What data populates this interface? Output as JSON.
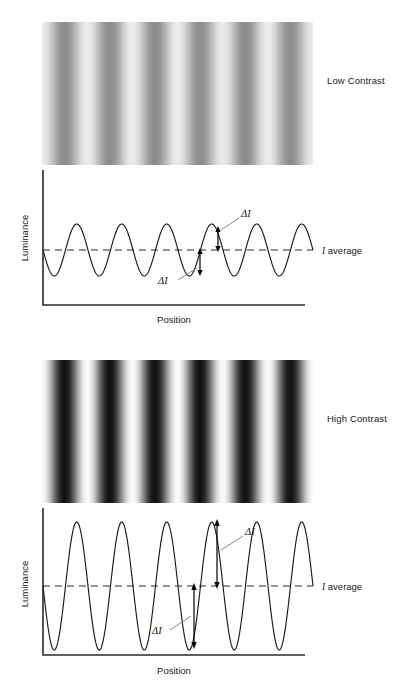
{
  "figure": {
    "background": "#ffffff",
    "width": 410,
    "height": 691
  },
  "panels": [
    {
      "id": "low",
      "side_label": "Low Contrast",
      "grating": {
        "name": "low-contrast-grating",
        "cycles": 6,
        "min_gray": "#8c8c8c",
        "max_gray": "#ebebeb"
      },
      "plot": {
        "ylabel": "Luminance",
        "xlabel": "Position",
        "average_label_symbol": "I",
        "average_label_text": " average",
        "delta_label_upper": "ΔI",
        "delta_label_lower": "ΔI"
      }
    },
    {
      "id": "high",
      "side_label": "High Contrast",
      "grating": {
        "name": "high-contrast-grating",
        "cycles": 6,
        "min_gray": "#111111",
        "max_gray": "#fbfbfb"
      },
      "plot": {
        "ylabel": "Luminance",
        "xlabel": "Position",
        "average_label_symbol": "I",
        "average_label_text": " average",
        "delta_label_upper": "ΔI",
        "delta_label_lower": "ΔI"
      }
    }
  ],
  "chart_data": [
    {
      "type": "line",
      "id": "low-contrast-luminance-profile",
      "title": "",
      "xlabel": "Position",
      "ylabel": "Luminance",
      "waveform": "sine",
      "cycles": 6,
      "phase": "descending-zero-crossing-at-origin",
      "mean_level": 0.5,
      "amplitude_fraction": 0.155,
      "ylim": [
        0,
        1
      ],
      "grid": false,
      "legend": false,
      "annotations": [
        {
          "label": "ΔI",
          "type": "arrow",
          "from": "mean",
          "to": "peak"
        },
        {
          "label": "ΔI",
          "type": "arrow",
          "from": "mean",
          "to": "trough"
        },
        {
          "label": "I average",
          "type": "dashed-reference-line",
          "value": 0.5
        }
      ]
    },
    {
      "type": "line",
      "id": "high-contrast-luminance-profile",
      "title": "",
      "xlabel": "Position",
      "ylabel": "Luminance",
      "waveform": "sine",
      "cycles": 6,
      "phase": "descending-zero-crossing-at-origin",
      "mean_level": 0.5,
      "amplitude_fraction": 0.45,
      "ylim": [
        0,
        1
      ],
      "grid": false,
      "legend": false,
      "annotations": [
        {
          "label": "ΔI",
          "type": "arrow",
          "from": "mean",
          "to": "peak"
        },
        {
          "label": "ΔI",
          "type": "arrow",
          "from": "mean",
          "to": "trough"
        },
        {
          "label": "I average",
          "type": "dashed-reference-line",
          "value": 0.5
        }
      ]
    }
  ]
}
